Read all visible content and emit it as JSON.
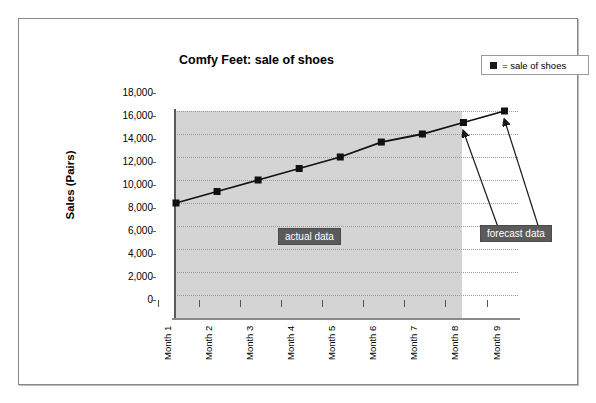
{
  "chart_data": {
    "type": "line",
    "title": "Comfy Feet: sale of shoes",
    "xlabel": "",
    "ylabel": "Sales (Pairs)",
    "categories": [
      "Month 1",
      "Month 2",
      "Month 3",
      "Month 4",
      "Month 5",
      "Month 6",
      "Month 7",
      "Month 8",
      "Month 9"
    ],
    "values": [
      10000,
      11000,
      12000,
      13000,
      14000,
      15300,
      16000,
      17000,
      18000
    ],
    "series": [
      {
        "name": "sale of shoes",
        "values": [
          10000,
          11000,
          12000,
          13000,
          14000,
          15300,
          16000,
          17000,
          18000
        ]
      }
    ],
    "ylim": [
      0,
      18000
    ],
    "ytick_labels": [
      "0",
      "2,000",
      "4,000",
      "6,000",
      "8,000",
      "10,000",
      "12,000",
      "14,000",
      "16,000",
      "18,000"
    ],
    "ytick_values": [
      0,
      2000,
      4000,
      6000,
      8000,
      10000,
      12000,
      14000,
      16000,
      18000
    ],
    "grid": true,
    "legend_position": "top-right",
    "marker": "square",
    "annotations": [
      {
        "text": "actual data",
        "region": "Month 1 to Month 7"
      },
      {
        "text": "forecast data",
        "region": "Month 8 to Month 9",
        "arrows_to": [
          "Month 8",
          "Month 9"
        ]
      }
    ],
    "shaded_region": {
      "label": "actual data",
      "from": "Month 1",
      "to": "Month 7",
      "color": "#d4d4d4"
    }
  },
  "legend": {
    "symbol": "square-marker",
    "text": "= sale of shoes"
  },
  "colors": {
    "line": "#111111",
    "marker": "#111111",
    "shade": "#d4d4d4",
    "annotation_bg": "#5b5b5b",
    "annotation_text": "#ffffff",
    "grid": "#9a9a9a",
    "frame": "#888888"
  }
}
